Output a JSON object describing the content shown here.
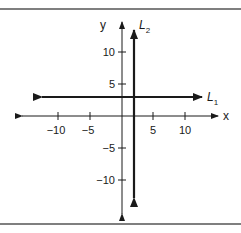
{
  "diagram": {
    "type": "coordinate-plane",
    "x_axis": {
      "label": "x",
      "ticks": [
        -10,
        -5,
        5,
        10
      ],
      "tick_labels": [
        "−10",
        "−5",
        "5",
        "10"
      ]
    },
    "y_axis": {
      "label": "y",
      "ticks": [
        10,
        5,
        -5,
        -10
      ],
      "tick_labels": [
        "10",
        "5",
        "−5",
        "−10"
      ]
    },
    "lines": [
      {
        "name": "L",
        "subscript": "1",
        "orientation": "horizontal",
        "equation": "y = 3"
      },
      {
        "name": "L",
        "subscript": "2",
        "orientation": "vertical",
        "equation": "x = 2"
      }
    ],
    "colors": {
      "ink": "#1a1a1a",
      "frame": "#555555",
      "background": "#ffffff"
    }
  }
}
